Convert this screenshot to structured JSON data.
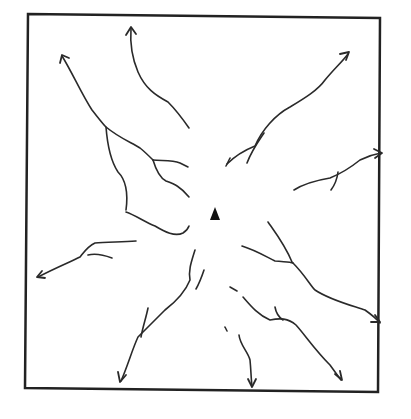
{
  "diagram": {
    "frame": {
      "x": 26,
      "y": 14,
      "width": 354,
      "height": 168
    },
    "peak": {
      "x": 215,
      "y": 214,
      "symbol": "triangle"
    },
    "stroke_color": "#2a2a2a",
    "stream_count": 10
  }
}
